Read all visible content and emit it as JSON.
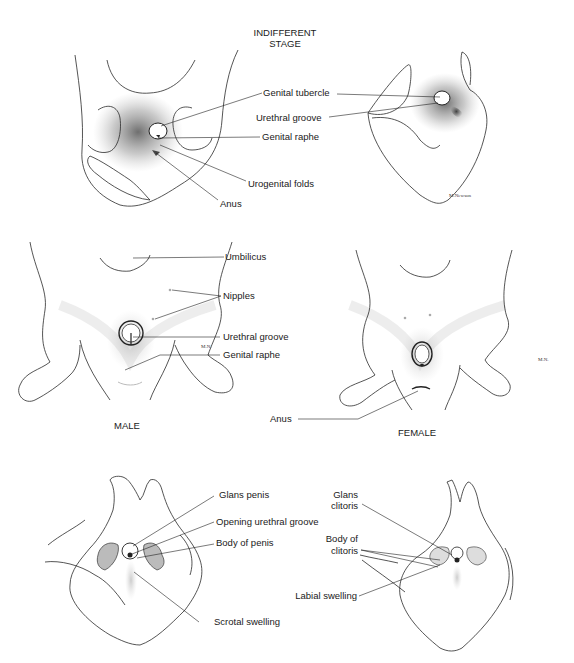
{
  "figure": {
    "title_line1": "INDIFFERENT",
    "title_line2": "STAGE",
    "panels": {
      "indifferent_front": {
        "labels": {
          "genital_tubercle": "Genital tubercle",
          "genital_raphe": "Genital raphe",
          "urogenital_folds": "Urogenital folds",
          "anus": "Anus"
        }
      },
      "indifferent_side": {
        "labels": {
          "urethral_groove": "Urethral groove"
        },
        "signature": "M.Newson"
      },
      "male_mid": {
        "caption": "MALE",
        "labels": {
          "umbilicus": "Umbilicus",
          "nipples": "Nipples",
          "urethral_groove": "Urethral groove",
          "genital_raphe": "Genital raphe"
        },
        "signature": "M.N."
      },
      "female_mid": {
        "caption": "FEMALE",
        "labels": {
          "anus": "Anus"
        },
        "signature": "M.N."
      },
      "male_late": {
        "labels": {
          "glans_penis": "Glans penis",
          "opening_urethral_groove": "Opening urethral groove",
          "body_of_penis": "Body of penis",
          "scrotal_swelling": "Scrotal swelling"
        }
      },
      "female_late": {
        "labels": {
          "glans_clitoris_1": "Glans",
          "glans_clitoris_2": "clitoris",
          "body_of_clitoris_1": "Body of",
          "body_of_clitoris_2": "clitoris",
          "labial_swelling": "Labial swelling"
        }
      }
    }
  }
}
